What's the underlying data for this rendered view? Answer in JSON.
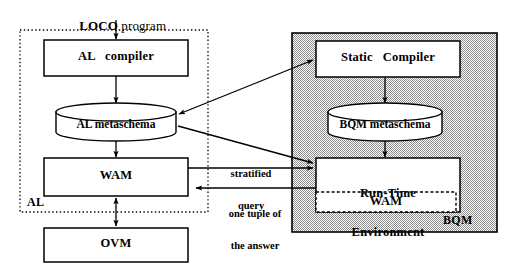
{
  "diagram": {
    "type": "architecture-block-diagram",
    "title_text": {
      "bold_part": "LOCO",
      "plain_part": " program"
    },
    "regions": [
      {
        "id": "al-region",
        "label": "AL",
        "border_style": "dotted",
        "fill": "#ffffff",
        "rect": {
          "x": 20,
          "y": 30,
          "w": 188,
          "h": 182
        }
      },
      {
        "id": "bqm-region",
        "label": "BQM",
        "border_style": "solid",
        "fill": "#c9c9c9",
        "rect": {
          "x": 292,
          "y": 33,
          "w": 205,
          "h": 199
        }
      }
    ],
    "boxes": [
      {
        "id": "al-compiler",
        "label": "AL   compiler",
        "shape": "rect",
        "x": 44,
        "y": 40,
        "w": 144,
        "h": 36
      },
      {
        "id": "al-metaschema",
        "label": "AL metaschema",
        "shape": "cylinder",
        "x": 56,
        "y": 104,
        "w": 120,
        "h": 36
      },
      {
        "id": "wam-al",
        "label": "WAM",
        "shape": "rect",
        "x": 44,
        "y": 158,
        "w": 144,
        "h": 38
      },
      {
        "id": "ovm",
        "label": "OVM",
        "shape": "rect",
        "x": 44,
        "y": 228,
        "w": 144,
        "h": 34
      },
      {
        "id": "static-compiler",
        "label": "Static   Compiler",
        "shape": "rect",
        "x": 316,
        "y": 41,
        "w": 144,
        "h": 36
      },
      {
        "id": "bqm-metaschema",
        "label": "BQM metaschema",
        "shape": "cylinder",
        "x": 328,
        "y": 104,
        "w": 114,
        "h": 36
      },
      {
        "id": "runtime-env",
        "label_line1": "Run-Time",
        "label_line2": "Environment",
        "shape": "rect",
        "x": 316,
        "y": 158,
        "w": 144,
        "h": 54
      },
      {
        "id": "wam-bqm",
        "label": "WAM",
        "shape": "rect-dashed",
        "x": 316,
        "y": 192,
        "w": 140,
        "h": 20
      }
    ],
    "edge_labels": [
      {
        "id": "stratified-query",
        "line1": "stratified",
        "line2": "query",
        "x": 214,
        "y": 148
      },
      {
        "id": "one-tuple",
        "line1": "one tuple of",
        "line2": "the answer",
        "x": 214,
        "y": 186
      }
    ],
    "connections": [
      {
        "from": "loco-program",
        "to": "al-compiler",
        "kind": "arrow",
        "direction": "down"
      },
      {
        "from": "al-compiler",
        "to": "al-metaschema",
        "kind": "arrow",
        "direction": "down"
      },
      {
        "from": "al-metaschema",
        "to": "wam-al",
        "kind": "arrow",
        "direction": "down"
      },
      {
        "from": "wam-al",
        "to": "ovm",
        "kind": "arrow",
        "direction": "bidirectional-vertical"
      },
      {
        "from": "static-compiler",
        "to": "al-metaschema",
        "kind": "arrow",
        "direction": "bidirectional-diagonal"
      },
      {
        "from": "al-metaschema",
        "to": "runtime-env",
        "kind": "arrow",
        "direction": "diagonal-right-down"
      },
      {
        "from": "wam-al",
        "to": "runtime-env",
        "kind": "arrow",
        "direction": "right",
        "label": "stratified-query"
      },
      {
        "from": "runtime-env",
        "to": "wam-al",
        "kind": "arrow",
        "direction": "left",
        "label": "one-tuple"
      },
      {
        "from": "static-compiler",
        "to": "bqm-metaschema",
        "kind": "arrow",
        "direction": "down"
      },
      {
        "from": "bqm-metaschema",
        "to": "runtime-env",
        "kind": "arrow",
        "direction": "down"
      }
    ],
    "colors": {
      "stroke": "#000000",
      "bqm_fill": "#c9c9c9",
      "box_fill": "#ffffff",
      "page_background": "#ffffff"
    }
  }
}
